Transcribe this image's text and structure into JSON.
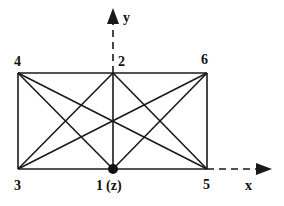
{
  "diagram": {
    "type": "truss-element",
    "nodes": [
      {
        "id": "1",
        "label": "1",
        "suffix": "(z)",
        "x": 113,
        "y": 169,
        "marked": true
      },
      {
        "id": "2",
        "label": "2",
        "x": 113,
        "y": 73
      },
      {
        "id": "3",
        "label": "3",
        "x": 18,
        "y": 169
      },
      {
        "id": "4",
        "label": "4",
        "x": 18,
        "y": 73
      },
      {
        "id": "5",
        "label": "5",
        "x": 207,
        "y": 169
      },
      {
        "id": "6",
        "label": "6",
        "x": 207,
        "y": 73
      }
    ],
    "edges": [
      [
        "4",
        "6"
      ],
      [
        "3",
        "5"
      ],
      [
        "4",
        "3"
      ],
      [
        "6",
        "5"
      ],
      [
        "2",
        "1"
      ],
      [
        "4",
        "1"
      ],
      [
        "4",
        "5"
      ],
      [
        "3",
        "2"
      ],
      [
        "3",
        "6"
      ],
      [
        "2",
        "5"
      ],
      [
        "1",
        "6"
      ]
    ],
    "axes": {
      "x_label": "x",
      "y_label": "y",
      "origin": {
        "x": 113,
        "y": 169
      },
      "x_tip": {
        "x": 272,
        "y": 169
      },
      "y_tip": {
        "x": 113,
        "y": 8
      }
    },
    "colors": {
      "line": "#1a1a1a",
      "background": "#ffffff"
    }
  }
}
